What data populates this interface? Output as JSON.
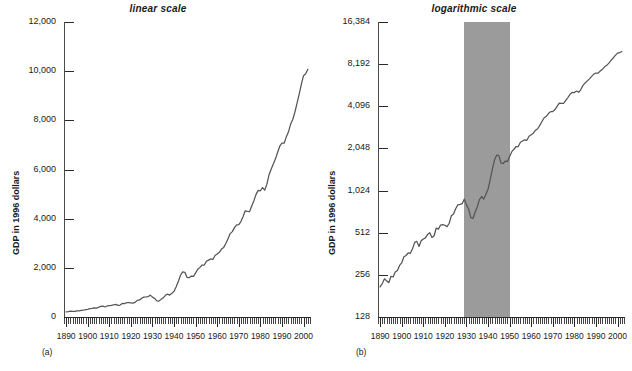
{
  "figure": {
    "caption_a": "(a)",
    "caption_b": "(b)"
  },
  "panels": [
    {
      "key": "linear",
      "title": "linear scale",
      "caption": "(a)",
      "ylabel": "GDP in 1996 dollars",
      "yticks": [
        "0",
        "2,000",
        "4,000",
        "6,000",
        "8,000",
        "10,000",
        "12,000"
      ],
      "xticks": [
        "1890",
        "1900",
        "1910",
        "1920",
        "1930",
        "1940",
        "1950",
        "1960",
        "1970",
        "1980",
        "1990",
        "2000"
      ]
    },
    {
      "key": "log",
      "title": "logarithmic scale",
      "caption": "(b)",
      "ylabel": "GDP in 1996 dollars",
      "yticks": [
        "128",
        "256",
        "512",
        "1,024",
        "2,048",
        "4,096",
        "8,192",
        "16,384"
      ],
      "xticks": [
        "1890",
        "1900",
        "1910",
        "1920",
        "1930",
        "1940",
        "1950",
        "1960",
        "1970",
        "1980",
        "1990",
        "2000"
      ]
    }
  ],
  "chart_data": [
    {
      "type": "line",
      "panel": "a",
      "title": "linear scale",
      "xlabel": "",
      "ylabel": "GDP in 1996 dollars",
      "scale": "linear",
      "xlim": [
        1889,
        2003
      ],
      "ylim": [
        0,
        12000
      ],
      "yticks": [
        0,
        2000,
        4000,
        6000,
        8000,
        10000,
        12000
      ],
      "xticks": [
        1890,
        1900,
        1910,
        1920,
        1930,
        1940,
        1950,
        1960,
        1970,
        1980,
        1990,
        2000
      ],
      "xtick_minor_interval": 1,
      "grid": false,
      "legend": false,
      "series_name": "Real GDP (billions of 1996 dollars)",
      "x": [
        1890,
        1891,
        1892,
        1893,
        1894,
        1895,
        1896,
        1897,
        1898,
        1899,
        1900,
        1901,
        1902,
        1903,
        1904,
        1905,
        1906,
        1907,
        1908,
        1909,
        1910,
        1911,
        1912,
        1913,
        1914,
        1915,
        1916,
        1917,
        1918,
        1919,
        1920,
        1921,
        1922,
        1923,
        1924,
        1925,
        1926,
        1927,
        1928,
        1929,
        1930,
        1931,
        1932,
        1933,
        1934,
        1935,
        1936,
        1937,
        1938,
        1939,
        1940,
        1941,
        1942,
        1943,
        1944,
        1945,
        1946,
        1947,
        1948,
        1949,
        1950,
        1951,
        1952,
        1953,
        1954,
        1955,
        1956,
        1957,
        1958,
        1959,
        1960,
        1961,
        1962,
        1963,
        1964,
        1965,
        1966,
        1967,
        1968,
        1969,
        1970,
        1971,
        1972,
        1973,
        1974,
        1975,
        1976,
        1977,
        1978,
        1979,
        1980,
        1981,
        1982,
        1983,
        1984,
        1985,
        1986,
        1987,
        1988,
        1989,
        1990,
        1991,
        1992,
        1993,
        1994,
        1995,
        1996,
        1997,
        1998,
        1999,
        2000,
        2001,
        2002
      ],
      "values": [
        210,
        222,
        240,
        232,
        225,
        250,
        247,
        268,
        275,
        299,
        312,
        345,
        352,
        368,
        365,
        393,
        437,
        444,
        408,
        448,
        462,
        470,
        498,
        512,
        473,
        487,
        553,
        543,
        581,
        585,
        579,
        566,
        598,
        677,
        697,
        760,
        809,
        816,
        825,
        890,
        809,
        756,
        656,
        647,
        717,
        781,
        883,
        929,
        891,
        962,
        1045,
        1227,
        1457,
        1698,
        1832,
        1819,
        1613,
        1597,
        1665,
        1651,
        1796,
        1941,
        2020,
        2114,
        2114,
        2265,
        2313,
        2360,
        2340,
        2501,
        2562,
        2630,
        2762,
        2831,
        2992,
        3187,
        3393,
        3473,
        3637,
        3751,
        3758,
        3880,
        4085,
        4320,
        4299,
        4289,
        4514,
        4731,
        4988,
        5150,
        5135,
        5265,
        5159,
        5394,
        5778,
        6014,
        6222,
        6434,
        6701,
        6949,
        7078,
        7071,
        7318,
        7522,
        7836,
        8032,
        8329,
        8704,
        9067,
        9470,
        9817,
        9891,
        10075
      ]
    },
    {
      "type": "line",
      "panel": "b",
      "title": "logarithmic scale",
      "xlabel": "",
      "ylabel": "GDP in 1996 dollars",
      "scale": "log2",
      "xlim": [
        1889,
        2003
      ],
      "ylim": [
        128,
        16384
      ],
      "yticks": [
        128,
        256,
        512,
        1024,
        2048,
        4096,
        8192,
        16384
      ],
      "xticks": [
        1890,
        1900,
        1910,
        1920,
        1930,
        1940,
        1950,
        1960,
        1970,
        1980,
        1990,
        2000
      ],
      "xtick_minor_interval": 1,
      "grid": false,
      "legend": false,
      "shaded_band": {
        "label": "",
        "x_start": 1929,
        "x_end": 1950,
        "color": "#9b9b9b"
      },
      "series_name": "Real GDP (billions of 1996 dollars)",
      "x": [
        1890,
        1891,
        1892,
        1893,
        1894,
        1895,
        1896,
        1897,
        1898,
        1899,
        1900,
        1901,
        1902,
        1903,
        1904,
        1905,
        1906,
        1907,
        1908,
        1909,
        1910,
        1911,
        1912,
        1913,
        1914,
        1915,
        1916,
        1917,
        1918,
        1919,
        1920,
        1921,
        1922,
        1923,
        1924,
        1925,
        1926,
        1927,
        1928,
        1929,
        1930,
        1931,
        1932,
        1933,
        1934,
        1935,
        1936,
        1937,
        1938,
        1939,
        1940,
        1941,
        1942,
        1943,
        1944,
        1945,
        1946,
        1947,
        1948,
        1949,
        1950,
        1951,
        1952,
        1953,
        1954,
        1955,
        1956,
        1957,
        1958,
        1959,
        1960,
        1961,
        1962,
        1963,
        1964,
        1965,
        1966,
        1967,
        1968,
        1969,
        1970,
        1971,
        1972,
        1973,
        1974,
        1975,
        1976,
        1977,
        1978,
        1979,
        1980,
        1981,
        1982,
        1983,
        1984,
        1985,
        1986,
        1987,
        1988,
        1989,
        1990,
        1991,
        1992,
        1993,
        1994,
        1995,
        1996,
        1997,
        1998,
        1999,
        2000,
        2001,
        2002
      ],
      "values": [
        210,
        222,
        240,
        232,
        225,
        250,
        247,
        268,
        275,
        299,
        312,
        345,
        352,
        368,
        365,
        393,
        437,
        444,
        408,
        448,
        462,
        470,
        498,
        512,
        473,
        487,
        553,
        543,
        581,
        585,
        579,
        566,
        598,
        677,
        697,
        760,
        809,
        816,
        825,
        890,
        809,
        756,
        656,
        647,
        717,
        781,
        883,
        929,
        891,
        962,
        1045,
        1227,
        1457,
        1698,
        1832,
        1819,
        1613,
        1597,
        1665,
        1651,
        1796,
        1941,
        2020,
        2114,
        2114,
        2265,
        2313,
        2360,
        2340,
        2501,
        2562,
        2630,
        2762,
        2831,
        2992,
        3187,
        3393,
        3473,
        3637,
        3751,
        3758,
        3880,
        4085,
        4320,
        4299,
        4289,
        4514,
        4731,
        4988,
        5150,
        5135,
        5265,
        5159,
        5394,
        5778,
        6014,
        6222,
        6434,
        6701,
        6949,
        7078,
        7071,
        7318,
        7522,
        7836,
        8032,
        8329,
        8704,
        9067,
        9470,
        9817,
        9891,
        10075
      ]
    }
  ]
}
